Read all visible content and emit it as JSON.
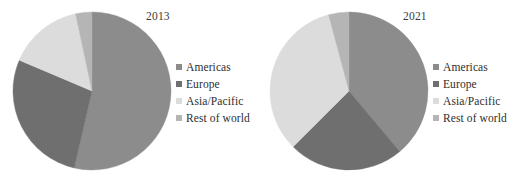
{
  "figure": {
    "background_color": "#ffffff",
    "panels": [
      {
        "id": "2013",
        "year_label": "2013"
      },
      {
        "id": "2021",
        "year_label": "2021"
      }
    ]
  },
  "legend": {
    "entries": [
      {
        "label": "Americas",
        "color": "#8c8c8c"
      },
      {
        "label": "Europe",
        "color": "#6f6f6f"
      },
      {
        "label": "Asia/Pacific",
        "color": "#dcdcdc"
      },
      {
        "label": "Rest of world",
        "color": "#b5b5b5"
      }
    ]
  },
  "chart_data": [
    {
      "type": "pie",
      "title": "2013",
      "xlabel": "",
      "ylabel": "",
      "legend_position": "right",
      "grid": false,
      "start_angle_deg": 0,
      "direction": "clockwise",
      "categories": [
        "Americas",
        "Europe",
        "Asia/Pacific",
        "Rest of world"
      ],
      "values": [
        53.6,
        27.8,
        15.3,
        3.3
      ],
      "value_unit": "percent",
      "slice_angles_deg": [
        193,
        100,
        55,
        12
      ],
      "colors": [
        "#8c8c8c",
        "#6f6f6f",
        "#dcdcdc",
        "#b5b5b5"
      ]
    },
    {
      "type": "pie",
      "title": "2021",
      "xlabel": "",
      "ylabel": "",
      "legend_position": "right",
      "grid": false,
      "start_angle_deg": 0,
      "direction": "clockwise",
      "categories": [
        "Americas",
        "Europe",
        "Asia/Pacific",
        "Rest of world"
      ],
      "values": [
        38.9,
        23.6,
        33.3,
        4.2
      ],
      "value_unit": "percent",
      "slice_angles_deg": [
        140,
        85,
        120,
        15
      ],
      "colors": [
        "#8c8c8c",
        "#6f6f6f",
        "#dcdcdc",
        "#b5b5b5"
      ]
    }
  ]
}
